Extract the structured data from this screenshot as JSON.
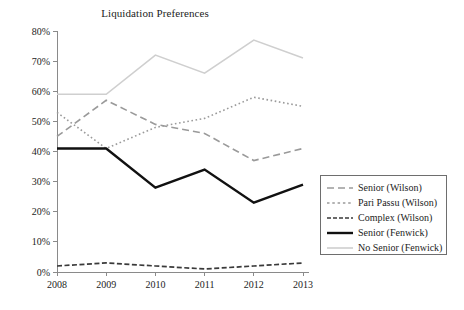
{
  "chart_data": {
    "type": "line",
    "title": "Liquidation Preferences",
    "xlabel": "",
    "ylabel": "",
    "categories": [
      "2008",
      "2009",
      "2010",
      "2011",
      "2012",
      "2013"
    ],
    "x": [
      2008,
      2009,
      2010,
      2011,
      2012,
      2013
    ],
    "ylim": [
      0,
      80
    ],
    "yticks": [
      "0%",
      "10%",
      "20%",
      "30%",
      "40%",
      "50%",
      "60%",
      "70%",
      "80%"
    ],
    "ytick_values": [
      0,
      10,
      20,
      30,
      40,
      50,
      60,
      70,
      80
    ],
    "grid": false,
    "legend_position": "right-outside",
    "series": [
      {
        "name": "Senior (Wilson)",
        "values": [
          45,
          57,
          49,
          46,
          37,
          41
        ],
        "color": "#9a9a9a",
        "style": "dashed",
        "dasharray": "7,4",
        "width": 1.6,
        "legend_dash": "7,4"
      },
      {
        "name": "Pari Passu (Wilson)",
        "values": [
          53,
          41,
          48,
          51,
          58,
          55
        ],
        "color": "#9a9a9a",
        "style": "dotted",
        "dasharray": "1.6,2.6",
        "width": 1.6,
        "legend_dash": "2.5,2.8"
      },
      {
        "name": "Complex (Wilson)",
        "values": [
          2,
          3,
          2,
          1,
          2,
          3
        ],
        "color": "#3a3a3a",
        "style": "dash-dot-short",
        "dasharray": "5,2.5",
        "width": 1.7,
        "legend_dash": "4,2"
      },
      {
        "name": "Senior (Fenwick)",
        "values": [
          41,
          41,
          28,
          34,
          23,
          29
        ],
        "color": "#111111",
        "style": "solid",
        "dasharray": "none",
        "width": 2.4,
        "legend_dash": "none"
      },
      {
        "name": "No Senior (Fenwick)",
        "values": [
          59,
          59,
          72,
          66,
          77,
          71
        ],
        "color": "#cfcfcf",
        "style": "solid",
        "dasharray": "none",
        "width": 1.6,
        "legend_dash": "none"
      }
    ]
  },
  "legend": {
    "entries": [
      "Senior (Wilson)",
      "Pari Passu (Wilson)",
      "Complex (Wilson)",
      "Senior (Fenwick)",
      "No Senior (Fenwick)"
    ]
  }
}
